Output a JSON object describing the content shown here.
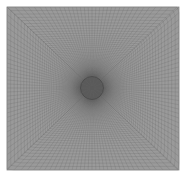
{
  "figure": {
    "title": "Structured O-Grid Mesh Around Circular Hole",
    "type": "mesh-visualization",
    "background_color": "#ffffff",
    "mesh_line_color": "#5a5a5a",
    "mesh_fill_color": "#9a9a9a",
    "hole_fill_color": "#6e6e6e",
    "hole_outline_color": "#4a4a4a",
    "boundary_color": "#8a8a8a"
  },
  "domain": {
    "shape": "square",
    "left_px": 7,
    "top_px": 7,
    "right_px": 179,
    "bottom_px": 170,
    "width_px": 172,
    "height_px": 163
  },
  "hole": {
    "shape": "circle",
    "center_x_px": 92,
    "center_y_px": 88,
    "radius_px": 11.5
  },
  "mesh_params": {
    "radial_divisions": 46,
    "circumferential_divisions": 132,
    "corner_blocks": 4,
    "topology": "o-grid-butterfly",
    "grading": "geometric-toward-hole",
    "grading_ratio": 1.045,
    "line_width_px": 0.35,
    "line_opacity": 0.55
  },
  "chart_data": {
    "type": "mesh",
    "title": "Structured O-Grid Mesh Around Circular Hole",
    "xlabel": "",
    "ylabel": "",
    "grid": true,
    "legend": false,
    "series": [
      {
        "name": "radial-lines",
        "count": 132,
        "description": "Lines running from the circular hole outward to the square outer boundary"
      },
      {
        "name": "circumferential-lines",
        "count": 46,
        "description": "Closed loops morphing from circle near the hole to square near the outer boundary"
      }
    ],
    "annotations": [
      {
        "label": "hole-center",
        "x": 92,
        "y": 88
      }
    ]
  }
}
